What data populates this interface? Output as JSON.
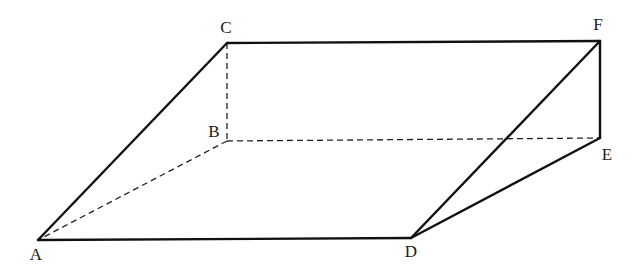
{
  "diagram": {
    "type": "triangular-prism",
    "vertices": {
      "A": {
        "label": "A",
        "x": 38,
        "y": 240,
        "label_x": 36,
        "label_y": 256
      },
      "B": {
        "label": "B",
        "x": 227,
        "y": 141,
        "label_x": 214,
        "label_y": 133
      },
      "C": {
        "label": "C",
        "x": 227,
        "y": 43,
        "label_x": 226,
        "label_y": 29
      },
      "D": {
        "label": "D",
        "x": 411,
        "y": 238,
        "label_x": 411,
        "label_y": 253
      },
      "E": {
        "label": "E",
        "x": 600,
        "y": 138,
        "label_x": 607,
        "label_y": 156
      },
      "F": {
        "label": "F",
        "x": 600,
        "y": 41,
        "label_x": 598,
        "label_y": 26
      }
    },
    "solid_edges": [
      [
        "A",
        "C"
      ],
      [
        "C",
        "F"
      ],
      [
        "A",
        "D"
      ],
      [
        "D",
        "F"
      ],
      [
        "D",
        "E"
      ],
      [
        "F",
        "E"
      ]
    ],
    "dashed_edges": [
      [
        "C",
        "B"
      ],
      [
        "B",
        "A"
      ],
      [
        "B",
        "E"
      ]
    ],
    "colors": {
      "line": "#111111",
      "background": "#ffffff"
    }
  }
}
